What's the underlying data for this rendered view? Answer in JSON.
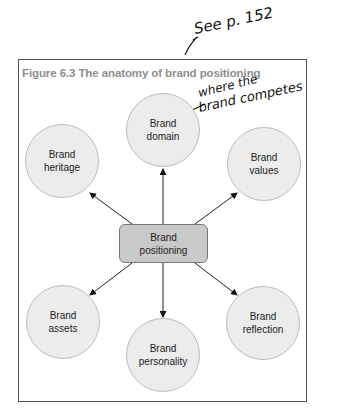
{
  "figure": {
    "title": "Figure 6.3  The anatomy of brand positioning"
  },
  "center": {
    "line1": "Brand",
    "line2": "positioning"
  },
  "nodes": [
    {
      "id": "domain",
      "line1": "Brand",
      "line2": "domain"
    },
    {
      "id": "heritage",
      "line1": "Brand",
      "line2": "heritage"
    },
    {
      "id": "values",
      "line1": "Brand",
      "line2": "values"
    },
    {
      "id": "assets",
      "line1": "Brand",
      "line2": "assets"
    },
    {
      "id": "reflection",
      "line1": "Brand",
      "line2": "reflection"
    },
    {
      "id": "personality",
      "line1": "Brand",
      "line2": "personality"
    }
  ],
  "annotations": {
    "see_page": "See p. 152",
    "note_line1": "where the",
    "note_line2": "brand competes"
  },
  "colors": {
    "circle_fill": "#ececec",
    "box_fill": "#c9c9c9",
    "title_color": "#8e8e8e"
  }
}
